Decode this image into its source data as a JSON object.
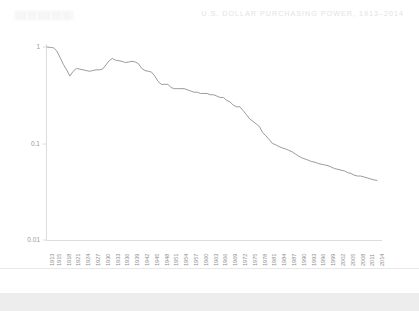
{
  "header": {
    "title": "U.S. DOLLAR PURCHASING POWER, 1913–2014",
    "logo_label": ""
  },
  "footer": {
    "source": "Source: Global Financial Data, Shiller"
  },
  "colors": {
    "background": "#ffffff",
    "title_text": "#e3e3e3",
    "line": "#9b9b9b",
    "axis": "#d8d8d8",
    "tick_text": "#8d8d8d",
    "source_text": "#2b2b2b",
    "bottom_band": "#ededed"
  },
  "chart_data": {
    "type": "line",
    "title": "U.S. DOLLAR PURCHASING POWER, 1913–2014",
    "xlabel": "",
    "ylabel": "",
    "yscale": "log",
    "ylim": [
      0.01,
      1
    ],
    "xlim": [
      1913,
      2014
    ],
    "grid": false,
    "legend": false,
    "ytick_labels": [
      "1",
      "0.1",
      "0.01"
    ],
    "ytick_values": [
      1,
      0.1,
      0.01
    ],
    "xtick_labels": [
      "1913",
      "1915",
      "1918",
      "1921",
      "1924",
      "1927",
      "1930",
      "1933",
      "1936",
      "1939",
      "1942",
      "1945",
      "1948",
      "1951",
      "1954",
      "1957",
      "1960",
      "1963",
      "1966",
      "1969",
      "1972",
      "1975",
      "1978",
      "1981",
      "1984",
      "1987",
      "1990",
      "1993",
      "1996",
      "1999",
      "2002",
      "2005",
      "2008",
      "2011",
      "2014"
    ],
    "series": [
      {
        "name": "U.S. Dollar Purchasing Power",
        "x": [
          1913,
          1914,
          1915,
          1916,
          1917,
          1918,
          1919,
          1920,
          1921,
          1922,
          1923,
          1924,
          1925,
          1926,
          1927,
          1928,
          1929,
          1930,
          1931,
          1932,
          1933,
          1934,
          1935,
          1936,
          1937,
          1938,
          1939,
          1940,
          1941,
          1942,
          1943,
          1944,
          1945,
          1946,
          1947,
          1948,
          1949,
          1950,
          1951,
          1952,
          1953,
          1954,
          1955,
          1956,
          1957,
          1958,
          1959,
          1960,
          1961,
          1962,
          1963,
          1964,
          1965,
          1966,
          1967,
          1968,
          1969,
          1970,
          1971,
          1972,
          1973,
          1974,
          1975,
          1976,
          1977,
          1978,
          1979,
          1980,
          1981,
          1982,
          1983,
          1984,
          1985,
          1986,
          1987,
          1988,
          1989,
          1990,
          1991,
          1992,
          1993,
          1994,
          1995,
          1996,
          1997,
          1998,
          1999,
          2000,
          2001,
          2002,
          2003,
          2004,
          2005,
          2006,
          2007,
          2008,
          2009,
          2010,
          2011,
          2012,
          2013,
          2014
        ],
        "values": [
          1.0,
          0.99,
          0.98,
          0.91,
          0.78,
          0.66,
          0.58,
          0.5,
          0.56,
          0.6,
          0.59,
          0.58,
          0.57,
          0.56,
          0.57,
          0.58,
          0.58,
          0.59,
          0.65,
          0.72,
          0.76,
          0.73,
          0.72,
          0.71,
          0.69,
          0.7,
          0.71,
          0.7,
          0.67,
          0.6,
          0.57,
          0.56,
          0.55,
          0.5,
          0.44,
          0.41,
          0.41,
          0.41,
          0.38,
          0.37,
          0.37,
          0.37,
          0.37,
          0.36,
          0.35,
          0.34,
          0.34,
          0.33,
          0.33,
          0.33,
          0.32,
          0.32,
          0.31,
          0.3,
          0.3,
          0.28,
          0.27,
          0.25,
          0.24,
          0.24,
          0.22,
          0.2,
          0.18,
          0.17,
          0.16,
          0.15,
          0.13,
          0.12,
          0.11,
          0.1,
          0.097,
          0.093,
          0.09,
          0.088,
          0.085,
          0.082,
          0.078,
          0.074,
          0.071,
          0.069,
          0.067,
          0.065,
          0.064,
          0.062,
          0.061,
          0.06,
          0.059,
          0.057,
          0.055,
          0.054,
          0.053,
          0.052,
          0.05,
          0.049,
          0.047,
          0.046,
          0.046,
          0.045,
          0.044,
          0.043,
          0.042,
          0.0415
        ]
      }
    ]
  }
}
